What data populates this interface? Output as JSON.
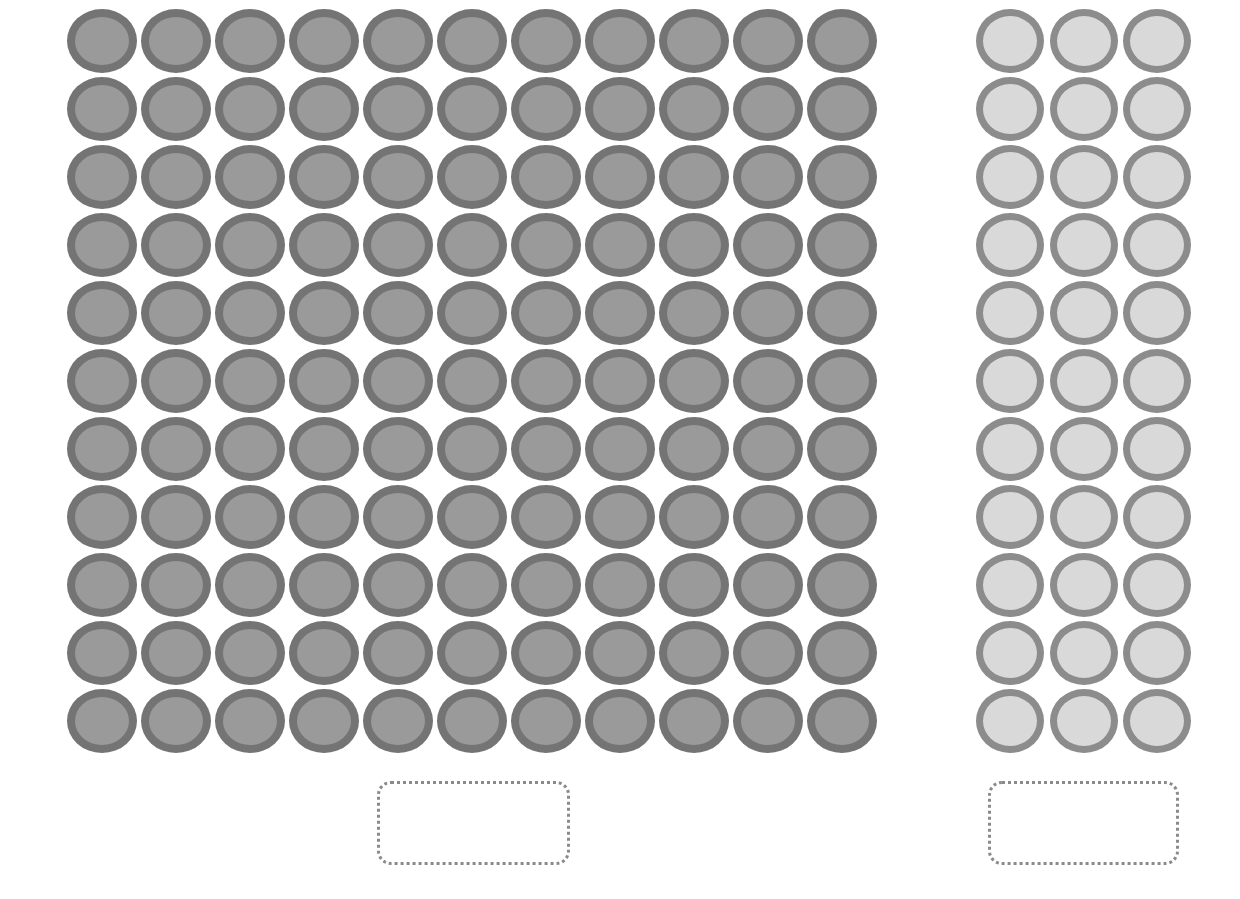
{
  "colors": {
    "dark_ring": "#747474",
    "dark_fill": "#9a9a9a",
    "light_ring": "#8c8c8c",
    "light_fill": "#d9d9d9",
    "box_border": "#8a8a8a"
  },
  "groups": [
    {
      "name": "hundreds-and-tens-block",
      "rows": 11,
      "cols": 11,
      "count": 121,
      "style": "dark"
    },
    {
      "name": "ones-block",
      "rows": 11,
      "cols": 3,
      "count": 33,
      "style": "light"
    }
  ],
  "answer_boxes": [
    {
      "name": "answer-box-left",
      "value": ""
    },
    {
      "name": "answer-box-right",
      "value": ""
    }
  ]
}
